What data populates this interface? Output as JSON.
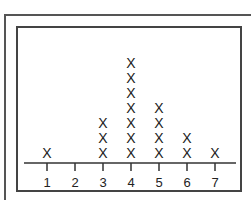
{
  "chart_data": {
    "type": "dot_plot",
    "title": "",
    "xlabel": "",
    "ylabel": "",
    "marker": "X",
    "categories": [
      "1",
      "2",
      "3",
      "4",
      "5",
      "6",
      "7"
    ],
    "values": [
      1,
      0,
      3,
      7,
      4,
      2,
      1
    ],
    "xlim": [
      1,
      7
    ],
    "grid": false,
    "legend": null
  },
  "colors": {
    "frame": "#444444",
    "text": "#222222",
    "background": "#ffffff"
  }
}
